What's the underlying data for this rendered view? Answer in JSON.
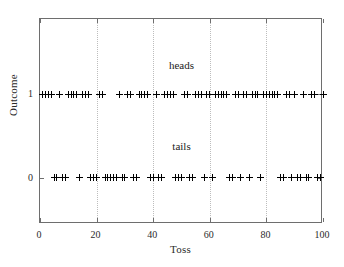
{
  "chart_data": {
    "type": "scatter",
    "title": "",
    "xlabel": "Toss",
    "ylabel": "Outcome",
    "xlim": [
      0,
      100
    ],
    "ylim": [
      -0.55,
      1.9
    ],
    "xticks": [
      0,
      20,
      40,
      60,
      80,
      100
    ],
    "xticklabels": [
      "0",
      "20",
      "40",
      "60",
      "80",
      "100"
    ],
    "yticks": [
      0,
      1
    ],
    "yticklabels": [
      "0",
      "1"
    ],
    "grid": "vertical-dotted",
    "legend": "none",
    "marker": "plus",
    "marker_color": "#000000",
    "annotations": [
      {
        "text": "heads",
        "x": 50,
        "y": 1.42
      },
      {
        "text": "tails",
        "x": 50,
        "y": 0.45
      }
    ],
    "series": [
      {
        "name": "Outcome",
        "x": [
          1,
          2,
          3,
          4,
          5,
          6,
          7,
          8,
          9,
          10,
          11,
          12,
          13,
          14,
          15,
          16,
          17,
          18,
          19,
          20,
          21,
          22,
          23,
          24,
          25,
          26,
          27,
          28,
          29,
          30,
          31,
          32,
          33,
          34,
          35,
          36,
          37,
          38,
          39,
          40,
          41,
          42,
          43,
          44,
          45,
          46,
          47,
          48,
          49,
          50,
          51,
          52,
          53,
          54,
          55,
          56,
          57,
          58,
          59,
          60,
          61,
          62,
          63,
          64,
          65,
          66,
          67,
          68,
          69,
          70,
          71,
          72,
          73,
          74,
          75,
          76,
          77,
          78,
          79,
          80,
          81,
          82,
          83,
          84,
          85,
          86,
          87,
          88,
          89,
          90,
          91,
          92,
          93,
          94,
          95,
          96,
          97,
          98,
          99,
          100
        ],
        "values": [
          1,
          1,
          1,
          1,
          0,
          0,
          1,
          0,
          0,
          1,
          1,
          1,
          1,
          0,
          1,
          1,
          1,
          0,
          0,
          0,
          1,
          1,
          0,
          0,
          0,
          0,
          0,
          1,
          0,
          0,
          1,
          1,
          0,
          0,
          1,
          1,
          1,
          1,
          0,
          0,
          1,
          0,
          0,
          1,
          1,
          1,
          1,
          0,
          0,
          0,
          1,
          1,
          0,
          0,
          1,
          1,
          1,
          0,
          1,
          1,
          0,
          1,
          1,
          1,
          1,
          1,
          0,
          0,
          1,
          1,
          0,
          1,
          1,
          0,
          1,
          1,
          1,
          0,
          1,
          1,
          1,
          1,
          1,
          1,
          0,
          0,
          1,
          1,
          0,
          1,
          0,
          0,
          1,
          0,
          0,
          1,
          1,
          0,
          0,
          1
        ],
        "heads_label": "heads",
        "tails_label": "tails"
      }
    ]
  },
  "axes": {
    "xlabel": "Toss",
    "ylabel": "Outcome"
  }
}
